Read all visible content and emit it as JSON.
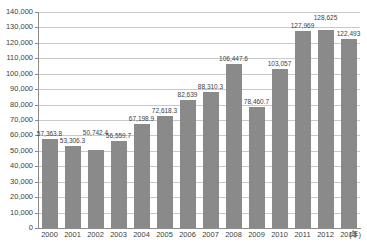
{
  "chart_data": {
    "type": "bar",
    "title": "",
    "xlabel": "",
    "ylabel": "",
    "x_axis_unit_suffix": "(年)",
    "categories": [
      "2000",
      "2001",
      "2002",
      "2003",
      "2004",
      "2005",
      "2006",
      "2007",
      "2008",
      "2009",
      "2010",
      "2011",
      "2012",
      "2013"
    ],
    "values": [
      57363.8,
      53306.3,
      50742.4,
      56559.7,
      67198.9,
      72618.3,
      82639,
      88310.3,
      106447.6,
      78460.7,
      103057,
      127969,
      128625,
      122493
    ],
    "value_labels": [
      "57,363.8",
      "53,306.3",
      "50,742.4",
      "56,559.7",
      "67,198.9",
      "72,618.3",
      "82,639",
      "88,310.3",
      "106,447.6",
      "78,460.7",
      "103,057",
      "127,969",
      "128,625",
      "122,493"
    ],
    "ylim": [
      0,
      140000
    ],
    "y_tick_step": 10000,
    "y_tick_labels": [
      "0",
      "10,000",
      "20,000",
      "30,000",
      "40,000",
      "50,000",
      "60,000",
      "70,000",
      "80,000",
      "90,000",
      "100,000",
      "110,000",
      "120,000",
      "130,000",
      "140,000"
    ],
    "grid": "horizontal",
    "legend": "none",
    "colors": {
      "bar": "#8a8a8a",
      "gridline": "#c9c9c9",
      "axis": "#8c8c8c",
      "text": "#404040",
      "background": "#ffffff"
    }
  }
}
